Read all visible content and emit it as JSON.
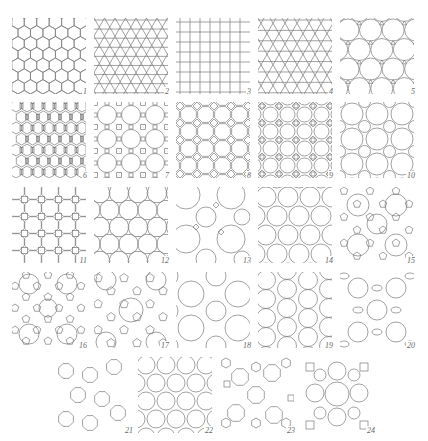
{
  "figure": {
    "line_color": "#7a7a7a",
    "background": "#ffffff",
    "panels": [
      {
        "id": 1,
        "label": "1",
        "pattern": "hexagonal",
        "x": 12,
        "y": 18
      },
      {
        "id": 2,
        "label": "2",
        "pattern": "triangular",
        "x": 94,
        "y": 18
      },
      {
        "id": 3,
        "label": "3",
        "pattern": "square",
        "x": 176,
        "y": 18
      },
      {
        "id": 4,
        "label": "4",
        "pattern": "kagome",
        "x": 258,
        "y": 18
      },
      {
        "id": 5,
        "label": "5",
        "pattern": "truncated-hexagonal",
        "x": 340,
        "y": 18
      },
      {
        "id": 6,
        "label": "6",
        "pattern": "elongated-mixed",
        "x": 12,
        "y": 102
      },
      {
        "id": 7,
        "label": "7",
        "pattern": "truncated-square-large",
        "x": 94,
        "y": 102
      },
      {
        "id": 8,
        "label": "8",
        "pattern": "truncated-square",
        "x": 176,
        "y": 102
      },
      {
        "id": 9,
        "label": "9",
        "pattern": "square-with-diamonds",
        "x": 258,
        "y": 102
      },
      {
        "id": 10,
        "label": "10",
        "pattern": "circle-packing-mixed",
        "x": 340,
        "y": 102
      },
      {
        "id": 11,
        "label": "11",
        "pattern": "octagon-square",
        "x": 12,
        "y": 187
      },
      {
        "id": 12,
        "label": "12",
        "pattern": "hexagon-circles",
        "x": 94,
        "y": 187
      },
      {
        "id": 13,
        "label": "13",
        "pattern": "large-circle-dense",
        "x": 176,
        "y": 187
      },
      {
        "id": 14,
        "label": "14",
        "pattern": "circle-hourglass",
        "x": 258,
        "y": 187
      },
      {
        "id": 15,
        "label": "15",
        "pattern": "circle-pentagon",
        "x": 340,
        "y": 187
      },
      {
        "id": 16,
        "label": "16",
        "pattern": "complex-circle-pentagon",
        "x": 12,
        "y": 272
      },
      {
        "id": 17,
        "label": "17",
        "pattern": "circle-pentagon-large",
        "x": 94,
        "y": 272
      },
      {
        "id": 18,
        "label": "18",
        "pattern": "big-circle-packing",
        "x": 176,
        "y": 272
      },
      {
        "id": 19,
        "label": "19",
        "pattern": "circle-grid-hourglass",
        "x": 258,
        "y": 272
      },
      {
        "id": 20,
        "label": "20",
        "pattern": "circle-lens",
        "x": 340,
        "y": 272
      },
      {
        "id": 21,
        "label": "21",
        "pattern": "octagon-chains",
        "x": 58,
        "y": 357
      },
      {
        "id": 22,
        "label": "22",
        "pattern": "circle-hourglass-dense",
        "x": 138,
        "y": 357
      },
      {
        "id": 23,
        "label": "23",
        "pattern": "octagon-square-hex",
        "x": 220,
        "y": 357
      },
      {
        "id": 24,
        "label": "24",
        "pattern": "circle-crossed",
        "x": 300,
        "y": 357
      }
    ]
  }
}
